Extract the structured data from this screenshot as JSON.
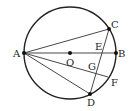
{
  "diagram": {
    "type": "circle-geometry",
    "circle": {
      "cx": 70,
      "cy": 53,
      "r": 46,
      "stroke": "#222222"
    },
    "points": {
      "A": {
        "x": 24,
        "y": 53,
        "label": "A",
        "lx": 13,
        "ly": 57,
        "dot": true
      },
      "B": {
        "x": 116,
        "y": 53,
        "label": "B",
        "lx": 118,
        "ly": 57,
        "dot": true
      },
      "O": {
        "x": 70,
        "y": 53,
        "label": "O",
        "lx": 66,
        "ly": 66,
        "dot": true
      },
      "C": {
        "x": 109,
        "y": 29,
        "label": "C",
        "lx": 111,
        "ly": 28,
        "dot": true
      },
      "D": {
        "x": 90,
        "y": 94,
        "label": "D",
        "lx": 87,
        "ly": 106,
        "dot": true
      },
      "E": {
        "x": 101,
        "y": 53,
        "label": "E",
        "lx": 95,
        "ly": 50,
        "dot": false
      },
      "G": {
        "x": 96,
        "y": 72,
        "label": "G",
        "lx": 88,
        "ly": 70,
        "dot": false
      },
      "F": {
        "x": 108,
        "y": 77,
        "label": "F",
        "lx": 111,
        "ly": 86,
        "dot": false
      }
    },
    "segments": [
      [
        "A",
        "B"
      ],
      [
        "A",
        "C"
      ],
      [
        "A",
        "D"
      ],
      [
        "A",
        "F"
      ],
      [
        "C",
        "D"
      ]
    ]
  }
}
